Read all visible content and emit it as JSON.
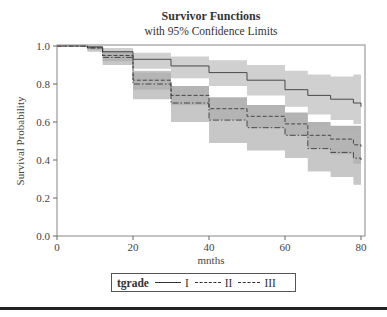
{
  "chart_data": {
    "type": "line",
    "title": "Survivor Functions",
    "subtitle": "with 95% Confidence Limits",
    "xlabel": "mnths",
    "ylabel": "Survival Probability",
    "xlim": [
      0,
      80
    ],
    "ylim": [
      0,
      1.0
    ],
    "xticks": [
      0,
      20,
      40,
      60,
      80
    ],
    "xtick_labels": [
      "0",
      "20",
      "40",
      "60",
      "80"
    ],
    "yticks": [
      0.0,
      0.2,
      0.4,
      0.6,
      0.8,
      1.0
    ],
    "ytick_labels": [
      "0.0",
      "0.2",
      "0.4",
      "0.6",
      "0.8",
      "1.0"
    ],
    "grid": false,
    "legend_position": "bottom",
    "legend_title": "tgrade",
    "series": [
      {
        "name": "I",
        "linestyle": "solid",
        "band_color": "#d0d0d0",
        "x": [
          0,
          8,
          12,
          20,
          30,
          40,
          50,
          60,
          66,
          72,
          78,
          80
        ],
        "y": [
          1.0,
          0.995,
          0.97,
          0.93,
          0.895,
          0.86,
          0.82,
          0.77,
          0.74,
          0.72,
          0.7,
          0.68
        ],
        "lower": [
          1.0,
          0.985,
          0.95,
          0.88,
          0.83,
          0.79,
          0.74,
          0.68,
          0.64,
          0.61,
          0.59,
          0.57
        ],
        "upper": [
          1.0,
          1.0,
          0.99,
          0.965,
          0.945,
          0.925,
          0.9,
          0.87,
          0.85,
          0.84,
          0.85,
          0.85
        ]
      },
      {
        "name": "II",
        "linestyle": "dashed",
        "band_color": "#9a9a9a",
        "x": [
          0,
          8,
          12,
          20,
          30,
          40,
          50,
          60,
          66,
          72,
          78,
          80
        ],
        "y": [
          1.0,
          0.99,
          0.95,
          0.82,
          0.74,
          0.67,
          0.63,
          0.59,
          0.53,
          0.51,
          0.48,
          0.47
        ],
        "lower": [
          1.0,
          0.98,
          0.92,
          0.77,
          0.69,
          0.61,
          0.57,
          0.53,
          0.46,
          0.43,
          0.38,
          0.35
        ],
        "upper": [
          1.0,
          1.0,
          0.97,
          0.86,
          0.79,
          0.73,
          0.69,
          0.65,
          0.6,
          0.58,
          0.58,
          0.58
        ]
      },
      {
        "name": "III",
        "linestyle": "dashdot",
        "band_color": "#b4b4b4",
        "x": [
          0,
          8,
          12,
          20,
          30,
          40,
          50,
          60,
          66,
          72,
          78,
          80
        ],
        "y": [
          1.0,
          0.99,
          0.94,
          0.8,
          0.7,
          0.61,
          0.57,
          0.53,
          0.46,
          0.44,
          0.41,
          0.4
        ],
        "lower": [
          1.0,
          0.97,
          0.9,
          0.72,
          0.6,
          0.49,
          0.45,
          0.41,
          0.34,
          0.31,
          0.27,
          0.27
        ],
        "upper": [
          1.0,
          1.0,
          0.97,
          0.87,
          0.79,
          0.72,
          0.68,
          0.64,
          0.58,
          0.56,
          0.55,
          0.55
        ]
      }
    ]
  },
  "legend": {
    "title": "tgrade",
    "entries": [
      "I",
      "II",
      "III"
    ]
  }
}
